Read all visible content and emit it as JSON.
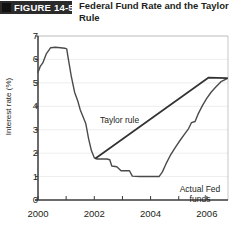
{
  "figure": {
    "banner_label": "FIGURE 14-5",
    "title": "Federal Fund Rate and the Taylor Rule",
    "banner_color": "#2b2b2b"
  },
  "chart_data": {
    "type": "line",
    "title": "Federal Fund Rate and the Taylor Rule",
    "xlabel": "",
    "ylabel": "Interest rate (%)",
    "xlim": [
      2000,
      2006.75
    ],
    "ylim": [
      0,
      7
    ],
    "ytick_labels": [
      "0",
      "1",
      "2",
      "3",
      "4",
      "5",
      "6",
      "7"
    ],
    "ytick_values": [
      0,
      1,
      2,
      3,
      4,
      5,
      6,
      7
    ],
    "xtick_labels": [
      "2000",
      "2002",
      "2004",
      "2006"
    ],
    "xtick_values": [
      2000,
      2002,
      2004,
      2006
    ],
    "x_minor_ticks": [
      2001,
      2003,
      2005
    ],
    "grid": "horizontal",
    "legend": "none",
    "annotations": [
      {
        "text": "Taylor rule",
        "x": 2002.0,
        "y": 4.75
      },
      {
        "text": "Actual Fed funds",
        "x": 2005.4,
        "y": 1.45
      }
    ],
    "series": [
      {
        "name": "Actual Fed funds",
        "color": "#4a4a4a",
        "points": [
          [
            2000.0,
            5.45
          ],
          [
            2000.08,
            5.7
          ],
          [
            2000.17,
            5.85
          ],
          [
            2000.3,
            6.25
          ],
          [
            2000.45,
            6.5
          ],
          [
            2000.62,
            6.52
          ],
          [
            2000.8,
            6.5
          ],
          [
            2000.95,
            6.48
          ],
          [
            2001.02,
            6.45
          ],
          [
            2001.08,
            6.0
          ],
          [
            2001.18,
            5.3
          ],
          [
            2001.3,
            4.6
          ],
          [
            2001.42,
            4.2
          ],
          [
            2001.5,
            3.85
          ],
          [
            2001.6,
            3.55
          ],
          [
            2001.7,
            3.25
          ],
          [
            2001.8,
            2.6
          ],
          [
            2001.9,
            2.1
          ],
          [
            2002.0,
            1.8
          ],
          [
            2002.1,
            1.75
          ],
          [
            2002.45,
            1.75
          ],
          [
            2002.55,
            1.72
          ],
          [
            2002.62,
            1.45
          ],
          [
            2002.8,
            1.42
          ],
          [
            2002.95,
            1.25
          ],
          [
            2003.25,
            1.25
          ],
          [
            2003.35,
            1.02
          ],
          [
            2003.6,
            1.0
          ],
          [
            2004.0,
            1.0
          ],
          [
            2004.3,
            1.0
          ],
          [
            2004.42,
            1.2
          ],
          [
            2004.55,
            1.55
          ],
          [
            2004.7,
            1.9
          ],
          [
            2004.88,
            2.25
          ],
          [
            2005.05,
            2.55
          ],
          [
            2005.2,
            2.8
          ],
          [
            2005.35,
            3.05
          ],
          [
            2005.45,
            3.3
          ],
          [
            2005.58,
            3.35
          ],
          [
            2005.7,
            3.7
          ],
          [
            2005.85,
            4.05
          ],
          [
            2006.0,
            4.35
          ],
          [
            2006.15,
            4.6
          ],
          [
            2006.3,
            4.8
          ],
          [
            2006.5,
            5.05
          ],
          [
            2006.72,
            5.18
          ]
        ]
      },
      {
        "name": "Taylor rule",
        "color": "#333333",
        "points": [
          [
            2002.05,
            1.78
          ],
          [
            2006.05,
            5.22
          ],
          [
            2006.72,
            5.2
          ]
        ]
      }
    ]
  }
}
